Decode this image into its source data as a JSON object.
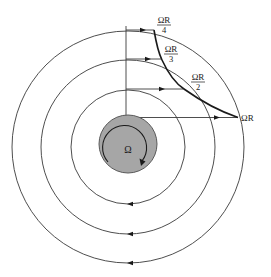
{
  "diagram": {
    "type": "rotating-disk-velocity-field",
    "center": {
      "x": 128,
      "y": 146
    },
    "disk": {
      "label": "Ω",
      "radius": 29,
      "fill": "#a6a6a6",
      "rotation": "clockwise"
    },
    "rings": [
      {
        "id": "inner",
        "radius": 57
      },
      {
        "id": "middle",
        "radius": 87
      },
      {
        "id": "outer",
        "radius": 116
      }
    ],
    "velocity_labels": [
      {
        "id": "v1",
        "numerator": "ΩR",
        "denominator": "",
        "text": "ΩR"
      },
      {
        "id": "v2",
        "numerator": "ΩR",
        "denominator": "2"
      },
      {
        "id": "v3",
        "numerator": "ΩR",
        "denominator": "3"
      },
      {
        "id": "v4",
        "numerator": "ΩR",
        "denominator": "4"
      }
    ],
    "colors": {
      "line": "#3a3a3a",
      "profile_curve": "#1a1a1a",
      "disk": "#a6a6a6",
      "background": "#ffffff"
    }
  }
}
